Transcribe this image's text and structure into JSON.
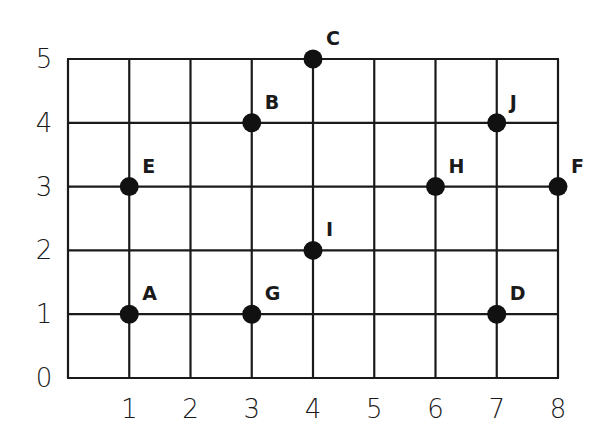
{
  "chart_data": {
    "type": "scatter",
    "title": "",
    "xlabel": "",
    "ylabel": "",
    "xlim": [
      0,
      8
    ],
    "ylim": [
      0,
      5
    ],
    "grid": true,
    "x_ticks": [
      "1",
      "2",
      "3",
      "4",
      "5",
      "6",
      "7",
      "8"
    ],
    "y_ticks": [
      "0",
      "1",
      "2",
      "3",
      "4",
      "5"
    ],
    "points": [
      {
        "label": "A",
        "x": 1,
        "y": 1
      },
      {
        "label": "B",
        "x": 3,
        "y": 4
      },
      {
        "label": "C",
        "x": 4,
        "y": 5
      },
      {
        "label": "D",
        "x": 7,
        "y": 1
      },
      {
        "label": "E",
        "x": 1,
        "y": 3
      },
      {
        "label": "F",
        "x": 8,
        "y": 3
      },
      {
        "label": "G",
        "x": 3,
        "y": 1
      },
      {
        "label": "H",
        "x": 6,
        "y": 3
      },
      {
        "label": "I",
        "x": 4,
        "y": 2
      },
      {
        "label": "J",
        "x": 7,
        "y": 4
      }
    ],
    "colors": {
      "line": "#1a1a1a",
      "point": "#111111",
      "background": "#ffffff"
    }
  }
}
